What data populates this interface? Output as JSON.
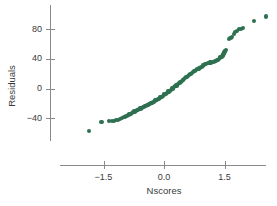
{
  "chart_data": {
    "type": "scatter",
    "title": "",
    "xlabel": "Nscores",
    "ylabel": "Residuals",
    "xlim": [
      -2.15,
      2.6
    ],
    "ylim": [
      -70,
      105
    ],
    "grid": false,
    "legend": "none",
    "point_color": "#2e7150",
    "axis_color": "#8a8a8a",
    "text_color": "#3b3b3b",
    "xticks": [
      -1.5,
      0.0,
      1.5
    ],
    "xticklabels": [
      "−1.5",
      "0.0",
      "1.5"
    ],
    "yticks": [
      -40,
      0,
      40,
      80
    ],
    "yticklabels": [
      "−40",
      "0",
      "40",
      "80"
    ],
    "points": [
      [
        -1.85,
        -57
      ],
      [
        -1.55,
        -45
      ],
      [
        -1.36,
        -44
      ],
      [
        -1.3,
        -44
      ],
      [
        -1.23,
        -44
      ],
      [
        -1.18,
        -43
      ],
      [
        -1.13,
        -42
      ],
      [
        -1.08,
        -41
      ],
      [
        -1.04,
        -40
      ],
      [
        -1.0,
        -39
      ],
      [
        -0.96,
        -38
      ],
      [
        -0.93,
        -37
      ],
      [
        -0.9,
        -36
      ],
      [
        -0.86,
        -35
      ],
      [
        -0.83,
        -34
      ],
      [
        -0.8,
        -33
      ],
      [
        -0.77,
        -32
      ],
      [
        -0.75,
        -31
      ],
      [
        -0.72,
        -31
      ],
      [
        -0.69,
        -30
      ],
      [
        -0.67,
        -29
      ],
      [
        -0.64,
        -29
      ],
      [
        -0.62,
        -28
      ],
      [
        -0.59,
        -27
      ],
      [
        -0.57,
        -27
      ],
      [
        -0.55,
        -26
      ],
      [
        -0.52,
        -25
      ],
      [
        -0.5,
        -25
      ],
      [
        -0.48,
        -24
      ],
      [
        -0.46,
        -24
      ],
      [
        -0.44,
        -23
      ],
      [
        -0.41,
        -22
      ],
      [
        -0.39,
        -22
      ],
      [
        -0.37,
        -21
      ],
      [
        -0.35,
        -21
      ],
      [
        -0.33,
        -20
      ],
      [
        -0.31,
        -19
      ],
      [
        -0.29,
        -19
      ],
      [
        -0.27,
        -18
      ],
      [
        -0.25,
        -18
      ],
      [
        -0.23,
        -17
      ],
      [
        -0.21,
        -16
      ],
      [
        -0.19,
        -16
      ],
      [
        -0.17,
        -15
      ],
      [
        -0.15,
        -14
      ],
      [
        -0.13,
        -14
      ],
      [
        -0.11,
        -13
      ],
      [
        -0.09,
        -12
      ],
      [
        -0.07,
        -11
      ],
      [
        -0.05,
        -11
      ],
      [
        -0.03,
        -10
      ],
      [
        -0.01,
        -9
      ],
      [
        0.01,
        -8
      ],
      [
        0.03,
        -8
      ],
      [
        0.05,
        -7
      ],
      [
        0.07,
        -6
      ],
      [
        0.09,
        -5
      ],
      [
        0.11,
        -4
      ],
      [
        0.13,
        -4
      ],
      [
        0.15,
        -3
      ],
      [
        0.17,
        -2
      ],
      [
        0.19,
        -1
      ],
      [
        0.21,
        0
      ],
      [
        0.23,
        1
      ],
      [
        0.25,
        2
      ],
      [
        0.27,
        3
      ],
      [
        0.29,
        3
      ],
      [
        0.31,
        4
      ],
      [
        0.33,
        5
      ],
      [
        0.35,
        6
      ],
      [
        0.37,
        7
      ],
      [
        0.39,
        8
      ],
      [
        0.41,
        9
      ],
      [
        0.44,
        10
      ],
      [
        0.46,
        11
      ],
      [
        0.48,
        12
      ],
      [
        0.5,
        13
      ],
      [
        0.52,
        14
      ],
      [
        0.55,
        15
      ],
      [
        0.57,
        16
      ],
      [
        0.59,
        17
      ],
      [
        0.62,
        18
      ],
      [
        0.64,
        19
      ],
      [
        0.67,
        20
      ],
      [
        0.69,
        21
      ],
      [
        0.72,
        22
      ],
      [
        0.75,
        23
      ],
      [
        0.77,
        24
      ],
      [
        0.8,
        25
      ],
      [
        0.83,
        26
      ],
      [
        0.86,
        27
      ],
      [
        0.9,
        28
      ],
      [
        0.93,
        29
      ],
      [
        0.96,
        31
      ],
      [
        1.0,
        32
      ],
      [
        1.02,
        33
      ],
      [
        1.05,
        33
      ],
      [
        1.08,
        34
      ],
      [
        1.11,
        34
      ],
      [
        1.14,
        35
      ],
      [
        1.17,
        35
      ],
      [
        1.2,
        36
      ],
      [
        1.23,
        36
      ],
      [
        1.26,
        37
      ],
      [
        1.29,
        37
      ],
      [
        1.32,
        38
      ],
      [
        1.34,
        39
      ],
      [
        1.36,
        40
      ],
      [
        1.38,
        41
      ],
      [
        1.4,
        42
      ],
      [
        1.42,
        43
      ],
      [
        1.43,
        43
      ],
      [
        1.45,
        44
      ],
      [
        1.46,
        45
      ],
      [
        1.47,
        46
      ],
      [
        1.48,
        47
      ],
      [
        1.49,
        48
      ],
      [
        1.5,
        49
      ],
      [
        1.51,
        50
      ],
      [
        1.52,
        51
      ],
      [
        1.54,
        52
      ],
      [
        1.62,
        67
      ],
      [
        1.65,
        68
      ],
      [
        1.69,
        70
      ],
      [
        1.73,
        73
      ],
      [
        1.77,
        76
      ],
      [
        1.81,
        78
      ],
      [
        1.86,
        80
      ],
      [
        1.92,
        80
      ],
      [
        1.97,
        81
      ],
      [
        2.23,
        91
      ],
      [
        2.52,
        97
      ]
    ]
  }
}
